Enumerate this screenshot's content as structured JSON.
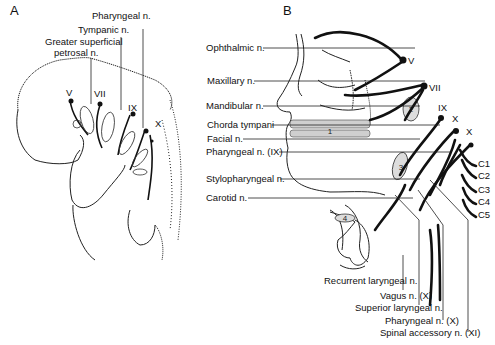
{
  "figure": {
    "panels": [
      {
        "label": "A",
        "description": "Embryo lateral view with branchial arch nerves",
        "nerve_labels": [
          "Pharyngeal n.",
          "Tympanic n.",
          "Greater superficial",
          "petrosal n."
        ],
        "cranial_nerves": [
          "V",
          "VII",
          "IX",
          "X"
        ]
      },
      {
        "label": "B",
        "description": "Adult head lateral view with cranial nerve distribution",
        "left_labels": [
          "Ophthalmic n.",
          "Maxillary n.",
          "Mandibular n.",
          "Chorda tympani",
          "Facial n.",
          "Pharyngeal n. (IX)",
          "Stylopharyngeal n.",
          "Carotid n."
        ],
        "cranial_nerves": [
          "V",
          "VII",
          "IX",
          "X",
          "X"
        ],
        "cervical_nerves": [
          "C1",
          "C2",
          "C3",
          "C4",
          "C5"
        ],
        "bottom_labels": [
          "Recurrent laryngeal n.",
          "Vagus n. (X)",
          "Superior laryngeal n.",
          "Pharyngeal n. (X)",
          "Spinal accessory n. (XI)"
        ],
        "arch_numbers": [
          "1",
          "2",
          "3",
          "4"
        ]
      }
    ]
  }
}
